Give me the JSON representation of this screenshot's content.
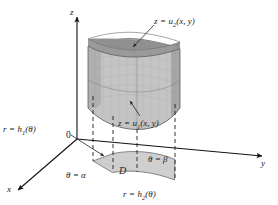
{
  "figure": {
    "background_color": "#ffffff",
    "axes": {
      "z_label": "z",
      "y_label": "y",
      "x_label": "x",
      "origin_label": "0",
      "axis_color": "#111111"
    },
    "labels": {
      "upper_surface": {
        "var": "z",
        "eq": "=",
        "fn": "u",
        "sub": "2",
        "args": "(x, y)"
      },
      "lower_surface": {
        "var": "z",
        "eq": "=",
        "fn": "u",
        "sub": "1",
        "args": "(x, y)"
      },
      "inner_radius": {
        "var": "r",
        "eq": "=",
        "fn": "h",
        "sub": "1",
        "args": "(θ)"
      },
      "outer_radius": {
        "var": "r",
        "eq": "=",
        "fn": "h",
        "sub": "2",
        "args": "(θ)"
      },
      "theta_start": "θ = α",
      "theta_end": "θ = β",
      "region": "D"
    },
    "colors": {
      "top_surface": "#9d9d9d",
      "side_surface": "#b4b4b4",
      "front_surface": "#c6c6c6",
      "bottom_surface": "#aeaeae",
      "region_fill": "#cfcfcf",
      "mesh_line": "#8a8a8a",
      "outline": "#555555",
      "dashed": "#222222",
      "leader": "#222222"
    },
    "style": {
      "dash_pattern": "4,3",
      "mesh_opacity": 0.35
    }
  }
}
